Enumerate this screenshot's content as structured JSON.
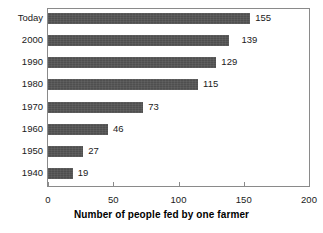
{
  "chart_data": {
    "type": "bar",
    "orientation": "horizontal",
    "title": "",
    "xlabel": "Number of people fed by one farmer",
    "ylabel": "",
    "categories": [
      "Today",
      "2000",
      "1990",
      "1980",
      "1970",
      "1960",
      "1950",
      "1940"
    ],
    "values": [
      155,
      139,
      129,
      115,
      73,
      46,
      27,
      19
    ],
    "value_labels": [
      "155",
      "139",
      "129",
      "115",
      "73",
      "46",
      "27",
      "19"
    ],
    "xlim": [
      0,
      200
    ],
    "xticks": [
      0,
      50,
      100,
      150,
      200
    ],
    "xtick_labels": [
      "0",
      "50",
      "100",
      "150",
      "200"
    ],
    "grid": false,
    "legend": false,
    "bar_color": "#4f4f4f",
    "frame_color": "#8a8a8a",
    "background_color": "#ffffff",
    "text_color": "#1a1a1a"
  }
}
